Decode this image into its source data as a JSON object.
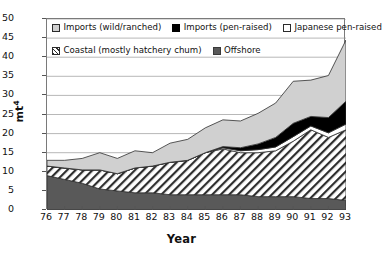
{
  "chart_data": {
    "type": "area",
    "stacked": true,
    "title": "",
    "xlabel": "Year",
    "ylabel": "mt⁴",
    "ylabel_base": "mt",
    "ylabel_exponent": "4",
    "categories": [
      "76",
      "77",
      "78",
      "79",
      "80",
      "81",
      "82",
      "83",
      "84",
      "85",
      "86",
      "87",
      "88",
      "89",
      "90",
      "91",
      "92",
      "93"
    ],
    "x": [
      1976,
      1977,
      1978,
      1979,
      1980,
      1981,
      1982,
      1983,
      1984,
      1985,
      1986,
      1987,
      1988,
      1989,
      1990,
      1991,
      1992,
      1993
    ],
    "ylim": [
      0,
      50
    ],
    "ytick_step": 5,
    "yticks": [
      "50",
      "45",
      "40",
      "35",
      "30",
      "25",
      "20",
      "15",
      "10",
      "5",
      "0"
    ],
    "ytick_values": [
      50,
      45,
      40,
      35,
      30,
      25,
      20,
      15,
      10,
      5,
      0
    ],
    "grid": "horizontal",
    "legend_position": "top-inside",
    "series": [
      {
        "name": "Imports (wild/ranched)",
        "key": "imports_wild",
        "color": "#d0d0d0",
        "pattern": "solid-light-gray",
        "stack_order": 5,
        "values": [
          1.5,
          2.0,
          3.0,
          4.5,
          4.0,
          4.5,
          3.5,
          5.0,
          5.5,
          6.5,
          7.0,
          7.0,
          8.0,
          9.0,
          11.0,
          9.5,
          11.0,
          16.0
        ]
      },
      {
        "name": "Imports (pen-raised)",
        "key": "imports_pen",
        "color": "#000000",
        "pattern": "solid-black",
        "stack_order": 4,
        "values": [
          0.0,
          0.0,
          0.0,
          0.0,
          0.0,
          0.0,
          0.0,
          0.0,
          0.0,
          0.0,
          0.3,
          0.8,
          1.5,
          2.5,
          3.5,
          2.5,
          4.0,
          6.0
        ]
      },
      {
        "name": "Japanese pen-raised",
        "key": "japanese_pen",
        "color": "#ffffff",
        "pattern": "solid-white",
        "stack_order": 3,
        "values": [
          0.0,
          0.0,
          0.0,
          0.0,
          0.0,
          0.0,
          0.0,
          0.0,
          0.0,
          0.0,
          0.3,
          0.5,
          0.8,
          1.0,
          1.2,
          1.0,
          1.2,
          1.5
        ]
      },
      {
        "name": "Coastal (mostly hatchery chum)",
        "key": "coastal",
        "color": "#ffffff",
        "pattern": "diagonal-hatch",
        "stack_order": 2,
        "values": [
          2.5,
          3.0,
          3.5,
          5.0,
          4.5,
          6.5,
          7.0,
          8.5,
          9.0,
          11.0,
          12.0,
          11.0,
          11.5,
          12.0,
          14.5,
          18.0,
          16.0,
          18.5
        ]
      },
      {
        "name": "Offshore",
        "key": "offshore",
        "color": "#595959",
        "pattern": "solid-dark-gray",
        "stack_order": 1,
        "values": [
          9.0,
          8.0,
          7.0,
          5.5,
          5.0,
          4.5,
          4.5,
          4.0,
          4.0,
          4.0,
          4.0,
          4.0,
          3.5,
          3.5,
          3.5,
          3.0,
          3.0,
          2.5
        ]
      }
    ],
    "totals": [
      13.0,
      13.0,
      13.5,
      15.0,
      13.5,
      15.5,
      15.0,
      17.5,
      18.5,
      21.5,
      23.6,
      23.3,
      25.3,
      28.0,
      33.7,
      34.0,
      35.2,
      44.5
    ]
  },
  "legend": {
    "rows": [
      {
        "items": [
          {
            "label": "Imports (wild/ranched)",
            "swatch": "sw-imports-wild",
            "icon": "legend-swatch-imports-wild"
          },
          {
            "label": "Imports (pen-raised)",
            "swatch": "sw-imports-pen",
            "icon": "legend-swatch-imports-pen"
          },
          {
            "label": "Japanese pen-raised",
            "swatch": "sw-japanese",
            "icon": "legend-swatch-japanese"
          }
        ]
      },
      {
        "items": [
          {
            "label": "Coastal (mostly hatchery chum)",
            "swatch": "sw-coastal",
            "icon": "legend-swatch-coastal"
          },
          {
            "label": "Offshore",
            "swatch": "sw-offshore",
            "icon": "legend-swatch-offshore"
          }
        ]
      }
    ]
  },
  "axes": {
    "y_title_base": "mt",
    "y_title_exponent": "4",
    "x_title": "Year"
  }
}
